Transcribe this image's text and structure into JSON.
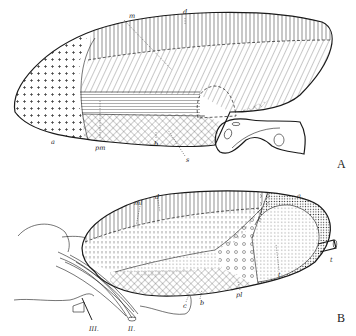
{
  "figure": {
    "panels": [
      {
        "id": "A",
        "label": "A",
        "annotations": [
          {
            "key": "m",
            "text": "m"
          },
          {
            "key": "d",
            "text": "d"
          },
          {
            "key": "a",
            "text": "a"
          },
          {
            "key": "pm",
            "text": "pm"
          },
          {
            "key": "b",
            "text": "b"
          },
          {
            "key": "s",
            "text": "s"
          }
        ]
      },
      {
        "id": "B",
        "label": "B",
        "annotations": [
          {
            "key": "ml",
            "text": "ml"
          },
          {
            "key": "d",
            "text": "d"
          },
          {
            "key": "a",
            "text": "a"
          },
          {
            "key": "t1",
            "text": "t"
          },
          {
            "key": "t2",
            "text": "t"
          },
          {
            "key": "pl",
            "text": "pl"
          },
          {
            "key": "b",
            "text": "b"
          },
          {
            "key": "c",
            "text": "c"
          },
          {
            "key": "III",
            "text": "III."
          },
          {
            "key": "II",
            "text": "II."
          }
        ]
      }
    ],
    "colors": {
      "ink": "#1a1a1a",
      "paper": "#ffffff"
    }
  }
}
